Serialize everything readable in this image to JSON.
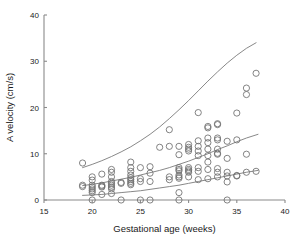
{
  "figure": {
    "background": "#ffffff",
    "axis_color": "#8a8a8a",
    "point_color": "#6e6e6e",
    "curve_color": "#7a7a7a",
    "text_color": "#1a1a1a"
  },
  "chart_data": {
    "type": "scatter",
    "title": "",
    "subtitle": "",
    "xlabel": "Gestational age (weeks)",
    "ylabel": "A velocity (cm/s)",
    "xlim": [
      15,
      40
    ],
    "ylim": [
      0,
      40
    ],
    "xticks": [
      15,
      20,
      25,
      30,
      35,
      40
    ],
    "xtick_labels": [
      "15",
      "20",
      "25",
      "30",
      "35",
      "40"
    ],
    "yticks": [
      0,
      10,
      20,
      30,
      40
    ],
    "ytick_labels": [
      "0",
      "10",
      "20",
      "30",
      "40"
    ],
    "grid": false,
    "legend": null,
    "marker": "open-circle",
    "marker_size": 3.1,
    "points": [
      [
        19.0,
        3.2
      ],
      [
        19.0,
        8.0
      ],
      [
        19.0,
        2.9
      ],
      [
        20.0,
        1.6
      ],
      [
        20.0,
        2.0
      ],
      [
        20.0,
        2.4
      ],
      [
        20.0,
        2.8
      ],
      [
        20.0,
        3.2
      ],
      [
        20.0,
        4.3
      ],
      [
        20.0,
        5.0
      ],
      [
        20.0,
        0.0
      ],
      [
        21.0,
        1.2
      ],
      [
        21.0,
        2.8
      ],
      [
        21.0,
        3.2
      ],
      [
        21.0,
        5.6
      ],
      [
        21.0,
        3.0
      ],
      [
        22.0,
        2.4
      ],
      [
        22.0,
        2.8
      ],
      [
        22.0,
        3.2
      ],
      [
        22.0,
        3.6
      ],
      [
        22.0,
        4.0
      ],
      [
        22.0,
        5.0
      ],
      [
        22.0,
        6.0
      ],
      [
        22.0,
        6.6
      ],
      [
        22.0,
        1.4
      ],
      [
        23.0,
        3.6
      ],
      [
        23.0,
        3.8
      ],
      [
        23.0,
        0.0
      ],
      [
        24.0,
        3.3
      ],
      [
        24.0,
        3.6
      ],
      [
        24.0,
        4.0
      ],
      [
        24.0,
        4.4
      ],
      [
        24.0,
        4.8
      ],
      [
        24.0,
        5.4
      ],
      [
        24.0,
        6.2
      ],
      [
        24.0,
        7.0
      ],
      [
        24.0,
        8.2
      ],
      [
        25.0,
        4.0
      ],
      [
        25.0,
        4.6
      ],
      [
        25.0,
        7.0
      ],
      [
        25.0,
        0.0
      ],
      [
        26.0,
        4.0
      ],
      [
        26.0,
        5.8
      ],
      [
        26.0,
        7.2
      ],
      [
        26.0,
        0.0
      ],
      [
        27.0,
        11.4
      ],
      [
        28.0,
        4.4
      ],
      [
        28.0,
        5.0
      ],
      [
        28.0,
        11.6
      ],
      [
        28.0,
        15.2
      ],
      [
        29.0,
        1.6
      ],
      [
        29.0,
        4.7
      ],
      [
        29.0,
        5.0
      ],
      [
        29.0,
        5.4
      ],
      [
        29.0,
        6.3
      ],
      [
        29.0,
        6.6
      ],
      [
        29.0,
        7.0
      ],
      [
        29.0,
        9.8
      ],
      [
        29.0,
        11.6
      ],
      [
        29.0,
        0.0
      ],
      [
        30.0,
        5.0
      ],
      [
        30.0,
        6.0
      ],
      [
        30.0,
        6.3
      ],
      [
        30.0,
        6.6
      ],
      [
        30.0,
        7.0
      ],
      [
        30.0,
        10.6
      ],
      [
        30.0,
        11.0
      ],
      [
        30.0,
        11.4
      ],
      [
        30.0,
        12.0
      ],
      [
        31.0,
        4.4
      ],
      [
        31.0,
        6.2
      ],
      [
        31.0,
        7.0
      ],
      [
        31.0,
        9.6
      ],
      [
        31.0,
        10.6
      ],
      [
        31.0,
        11.6
      ],
      [
        31.0,
        12.8
      ],
      [
        31.0,
        18.9
      ],
      [
        32.0,
        4.6
      ],
      [
        32.0,
        6.6
      ],
      [
        32.0,
        8.2
      ],
      [
        32.0,
        9.6
      ],
      [
        32.0,
        11.0
      ],
      [
        32.0,
        12.4
      ],
      [
        32.0,
        13.4
      ],
      [
        32.0,
        15.6
      ],
      [
        32.0,
        15.9
      ],
      [
        33.0,
        5.0
      ],
      [
        33.0,
        6.0
      ],
      [
        33.0,
        6.8
      ],
      [
        33.0,
        9.9
      ],
      [
        33.0,
        10.1
      ],
      [
        33.0,
        11.0
      ],
      [
        33.0,
        13.0
      ],
      [
        33.0,
        13.4
      ],
      [
        33.0,
        16.3
      ],
      [
        33.0,
        16.5
      ],
      [
        34.0,
        3.9
      ],
      [
        34.0,
        5.2
      ],
      [
        34.0,
        6.0
      ],
      [
        34.0,
        9.0
      ],
      [
        34.0,
        12.7
      ],
      [
        34.0,
        0.0
      ],
      [
        35.0,
        5.2
      ],
      [
        35.0,
        5.3
      ],
      [
        35.0,
        13.0
      ],
      [
        35.0,
        18.8
      ],
      [
        36.0,
        6.0
      ],
      [
        36.0,
        9.9
      ],
      [
        36.0,
        22.8
      ],
      [
        36.0,
        24.2
      ],
      [
        37.0,
        6.2
      ],
      [
        37.0,
        27.4
      ]
    ],
    "curves": [
      {
        "name": "upper-percentile-curve",
        "x_start": 19.0,
        "x_end": 37.0,
        "points": [
          [
            19.0,
            7.0
          ],
          [
            20.0,
            7.7
          ],
          [
            21.0,
            8.5
          ],
          [
            22.0,
            9.4
          ],
          [
            23.0,
            10.4
          ],
          [
            24.0,
            11.5
          ],
          [
            25.0,
            12.8
          ],
          [
            26.0,
            14.2
          ],
          [
            27.0,
            15.8
          ],
          [
            28.0,
            17.6
          ],
          [
            29.0,
            19.5
          ],
          [
            30.0,
            21.5
          ],
          [
            31.0,
            23.6
          ],
          [
            32.0,
            25.7
          ],
          [
            33.0,
            27.7
          ],
          [
            34.0,
            29.6
          ],
          [
            35.0,
            31.3
          ],
          [
            36.0,
            32.8
          ],
          [
            37.0,
            34.0
          ]
        ]
      },
      {
        "name": "median-curve",
        "x_start": 19.0,
        "x_end": 37.2,
        "points": [
          [
            19.0,
            3.1
          ],
          [
            20.0,
            3.4
          ],
          [
            21.0,
            3.7
          ],
          [
            22.0,
            4.1
          ],
          [
            23.0,
            4.5
          ],
          [
            24.0,
            4.9
          ],
          [
            25.0,
            5.4
          ],
          [
            26.0,
            5.9
          ],
          [
            27.0,
            6.4
          ],
          [
            28.0,
            7.0
          ],
          [
            29.0,
            7.7
          ],
          [
            30.0,
            8.4
          ],
          [
            31.0,
            9.2
          ],
          [
            32.0,
            10.0
          ],
          [
            33.0,
            10.9
          ],
          [
            34.0,
            11.7
          ],
          [
            35.0,
            12.6
          ],
          [
            36.0,
            13.4
          ],
          [
            37.2,
            14.2
          ]
        ]
      },
      {
        "name": "lower-percentile-curve",
        "x_start": 19.0,
        "x_end": 37.2,
        "points": [
          [
            19.0,
            1.0
          ],
          [
            20.0,
            1.1
          ],
          [
            21.0,
            1.2
          ],
          [
            22.0,
            1.4
          ],
          [
            23.0,
            1.6
          ],
          [
            24.0,
            1.8
          ],
          [
            25.0,
            2.0
          ],
          [
            26.0,
            2.3
          ],
          [
            27.0,
            2.6
          ],
          [
            28.0,
            2.9
          ],
          [
            29.0,
            3.2
          ],
          [
            30.0,
            3.6
          ],
          [
            31.0,
            4.0
          ],
          [
            32.0,
            4.4
          ],
          [
            33.0,
            4.8
          ],
          [
            34.0,
            5.2
          ],
          [
            35.0,
            5.6
          ],
          [
            36.0,
            6.0
          ],
          [
            37.2,
            6.4
          ]
        ]
      }
    ]
  }
}
